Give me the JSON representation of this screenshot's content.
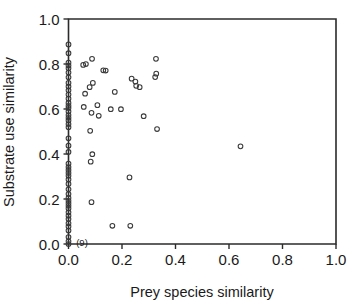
{
  "chart_data": {
    "type": "scatter",
    "title": "",
    "xlabel": "Prey species similarity",
    "ylabel": "Substrate use similarity",
    "xlim": [
      0.0,
      1.0
    ],
    "ylim": [
      0.0,
      1.0
    ],
    "xticks": [
      0.0,
      0.2,
      0.4,
      0.6,
      0.8,
      1.0
    ],
    "yticks": [
      0.0,
      0.2,
      0.4,
      0.6,
      0.8,
      1.0
    ],
    "xticklabels": [
      "0.0",
      "0.2",
      "0.4",
      "0.6",
      "0.8",
      "1.0"
    ],
    "yticklabels": [
      "0.0",
      "0.2",
      "0.4",
      "0.6",
      "0.8",
      "1.0"
    ],
    "grid": false,
    "legend": false,
    "marker": "open-circle",
    "marker_color": "#3a3a3a",
    "annotations": [
      {
        "text": "(9)",
        "x": 0.012,
        "y": 0.0,
        "meaning": "nine overlapping points at origin"
      }
    ],
    "series": [
      {
        "name": "species pairs",
        "points": [
          [
            0.0,
            0.887
          ],
          [
            0.0,
            0.848
          ],
          [
            0.0,
            0.806
          ],
          [
            0.0,
            0.793
          ],
          [
            0.0,
            0.781
          ],
          [
            0.0,
            0.762
          ],
          [
            0.0,
            0.741
          ],
          [
            0.0,
            0.716
          ],
          [
            0.0,
            0.7
          ],
          [
            0.0,
            0.683
          ],
          [
            0.0,
            0.664
          ],
          [
            0.0,
            0.646
          ],
          [
            0.0,
            0.627
          ],
          [
            0.0,
            0.614
          ],
          [
            0.0,
            0.604
          ],
          [
            0.0,
            0.589
          ],
          [
            0.0,
            0.573
          ],
          [
            0.0,
            0.561
          ],
          [
            0.0,
            0.549
          ],
          [
            0.0,
            0.533
          ],
          [
            0.0,
            0.519
          ],
          [
            0.0,
            0.47
          ],
          [
            0.0,
            0.437
          ],
          [
            0.0,
            0.409
          ],
          [
            0.0,
            0.357
          ],
          [
            0.0,
            0.342
          ],
          [
            0.0,
            0.329
          ],
          [
            0.0,
            0.316
          ],
          [
            0.0,
            0.303
          ],
          [
            0.0,
            0.287
          ],
          [
            0.0,
            0.267
          ],
          [
            0.0,
            0.243
          ],
          [
            0.0,
            0.222
          ],
          [
            0.0,
            0.205
          ],
          [
            0.0,
            0.192
          ],
          [
            0.0,
            0.181
          ],
          [
            0.0,
            0.17
          ],
          [
            0.0,
            0.158
          ],
          [
            0.0,
            0.141
          ],
          [
            0.0,
            0.126
          ],
          [
            0.0,
            0.111
          ],
          [
            0.0,
            0.092
          ],
          [
            0.0,
            0.078
          ],
          [
            0.0,
            0.06
          ],
          [
            0.0,
            0.031
          ],
          [
            0.0,
            0.012
          ],
          [
            0.0,
            0.0
          ],
          [
            0.055,
            0.796
          ],
          [
            0.065,
            0.8
          ],
          [
            0.088,
            0.823
          ],
          [
            0.057,
            0.609
          ],
          [
            0.062,
            0.668
          ],
          [
            0.079,
            0.697
          ],
          [
            0.091,
            0.716
          ],
          [
            0.086,
            0.583
          ],
          [
            0.081,
            0.503
          ],
          [
            0.083,
            0.366
          ],
          [
            0.089,
            0.399
          ],
          [
            0.086,
            0.186
          ],
          [
            0.108,
            0.617
          ],
          [
            0.113,
            0.57
          ],
          [
            0.13,
            0.772
          ],
          [
            0.139,
            0.771
          ],
          [
            0.158,
            0.599
          ],
          [
            0.164,
            0.081
          ],
          [
            0.173,
            0.676
          ],
          [
            0.196,
            0.599
          ],
          [
            0.228,
            0.296
          ],
          [
            0.231,
            0.081
          ],
          [
            0.236,
            0.735
          ],
          [
            0.25,
            0.722
          ],
          [
            0.253,
            0.703
          ],
          [
            0.266,
            0.697
          ],
          [
            0.281,
            0.568
          ],
          [
            0.327,
            0.823
          ],
          [
            0.328,
            0.757
          ],
          [
            0.324,
            0.742
          ],
          [
            0.331,
            0.511
          ],
          [
            0.643,
            0.434
          ]
        ]
      }
    ]
  },
  "axes": {
    "x_title": "Prey species similarity",
    "y_title": "Substrate use similarity"
  }
}
